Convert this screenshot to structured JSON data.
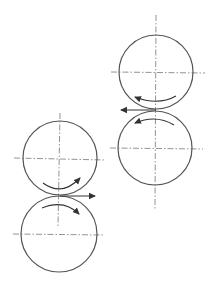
{
  "diagram": {
    "type": "rolling-mill-rolls",
    "colors": {
      "roll_stroke": "#555555",
      "center_line": "#777777",
      "arrow": "#333333",
      "background": "#ffffff"
    },
    "pairs": [
      {
        "id": "left-pair",
        "feed_direction": "right",
        "rolls": [
          {
            "position": "upper",
            "cx": 60,
            "cy": 158,
            "r": 37,
            "rotation": "clockwise"
          },
          {
            "position": "lower",
            "cx": 59,
            "cy": 234,
            "r": 38,
            "rotation": "counter-clockwise"
          }
        ],
        "contact_point": {
          "x": 59,
          "y": 196
        }
      },
      {
        "id": "right-pair",
        "feed_direction": "left",
        "rolls": [
          {
            "position": "upper",
            "cx": 156,
            "cy": 72,
            "r": 37,
            "rotation": "counter-clockwise"
          },
          {
            "position": "lower",
            "cx": 155,
            "cy": 148,
            "r": 37,
            "rotation": "clockwise"
          }
        ],
        "contact_point": {
          "x": 156,
          "y": 110
        }
      }
    ]
  }
}
